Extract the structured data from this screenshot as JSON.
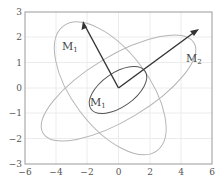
{
  "figure": {
    "xaxis": {
      "min": -6,
      "max": 6,
      "ticks": [
        "−6",
        "−4",
        "−2",
        "0",
        "2",
        "4",
        "6"
      ]
    },
    "yaxis": {
      "min": -3,
      "max": 3,
      "ticks": [
        "3",
        "2",
        "1",
        "0",
        "−1",
        "−2",
        "−3"
      ]
    },
    "labels": {
      "m1_outer": {
        "main": "M",
        "sub": "1"
      },
      "m1_inner": {
        "main": "M",
        "sub": "1"
      },
      "m2": {
        "main": "M",
        "sub": "2"
      }
    },
    "vectors": [
      {
        "name": "M1",
        "from": [
          0,
          0
        ],
        "to": [
          -2.3,
          2.3
        ]
      },
      {
        "name": "M2",
        "from": [
          0,
          0
        ],
        "to": [
          5.7,
          2.3
        ]
      }
    ],
    "colors": {
      "axis": "#999999",
      "grid": "#ececec",
      "vector": "#333333",
      "ellipse_light": "#b5b5b5",
      "ellipse_dark": "#555555"
    }
  }
}
